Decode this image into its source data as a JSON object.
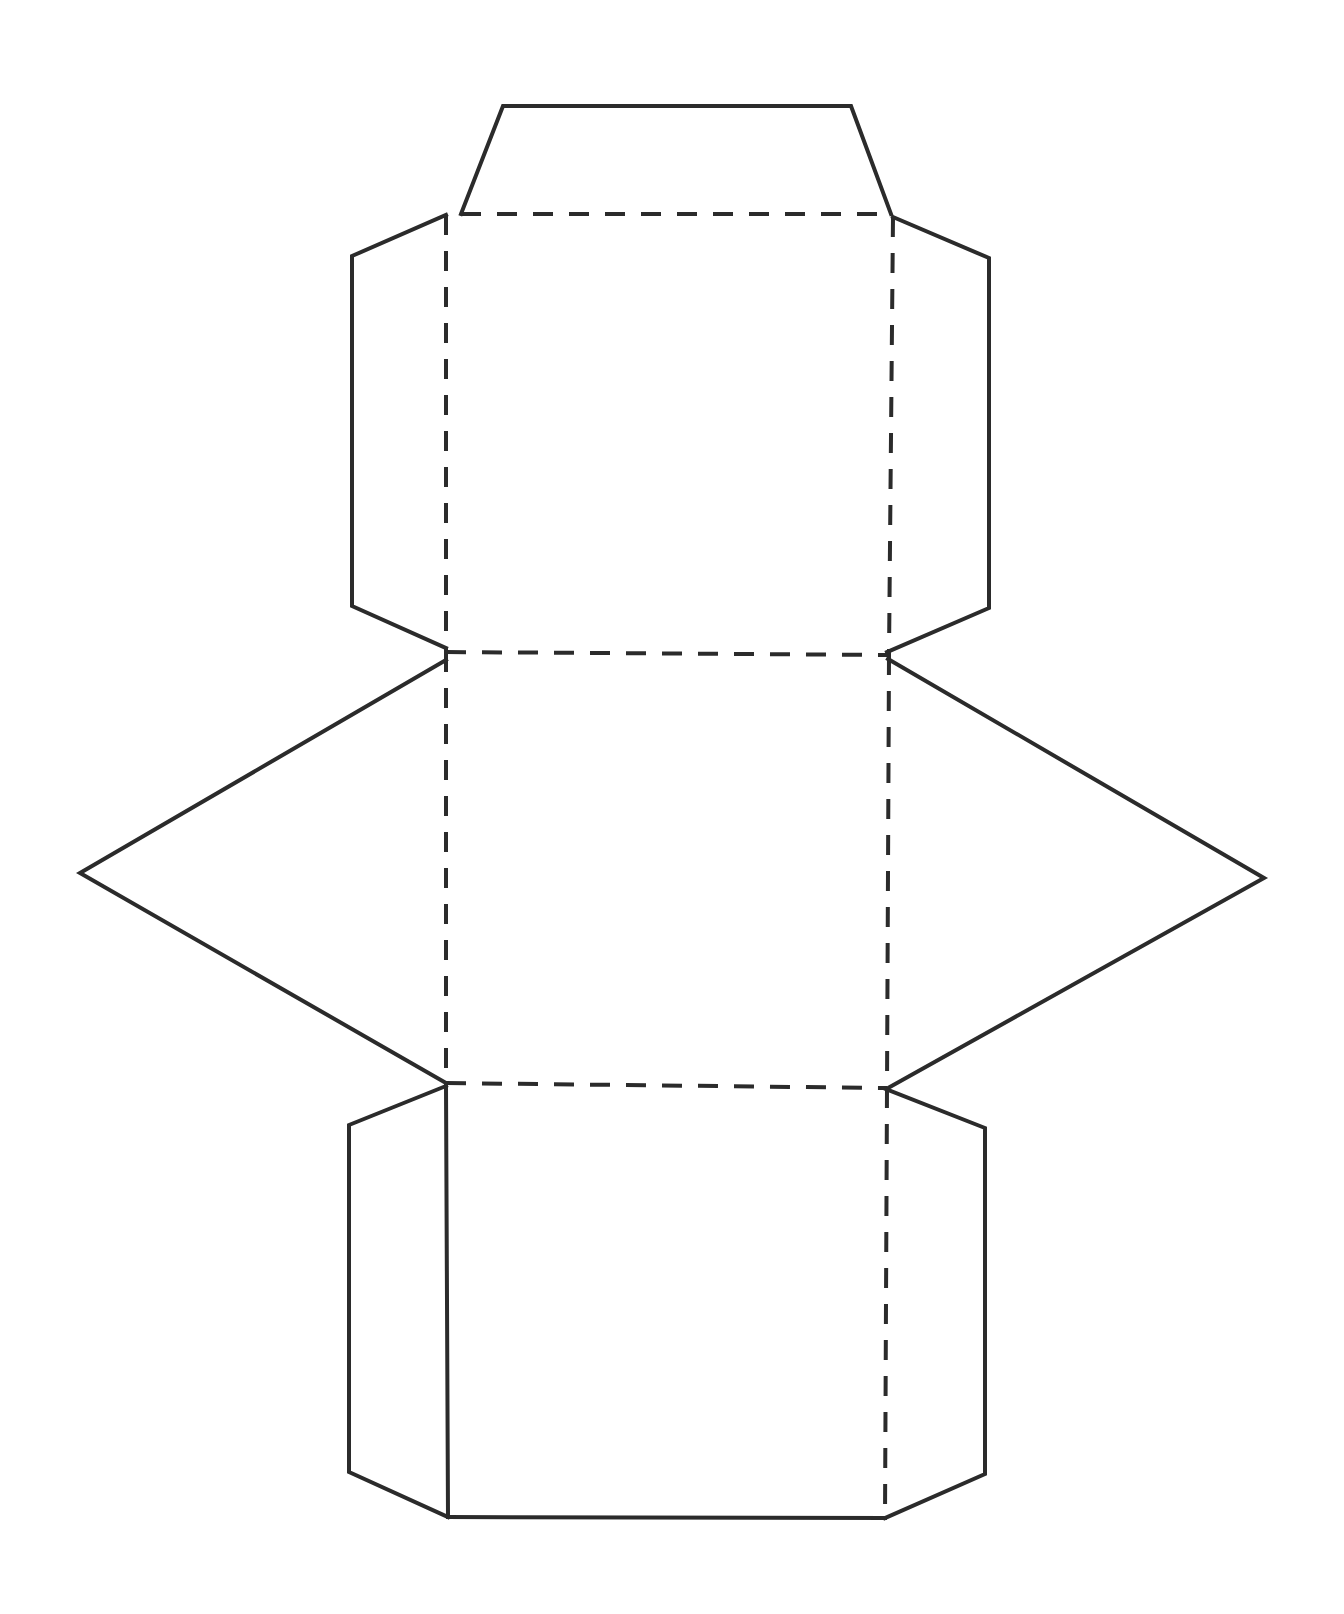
{
  "diagram": {
    "type": "paper-net-template",
    "canvas": {
      "width": 1344,
      "height": 1614,
      "background": "#ffffff"
    },
    "colors": {
      "line": "#2b2b2b"
    },
    "cut_lines": [
      {
        "name": "top-flap",
        "points": [
          [
            461,
            214
          ],
          [
            503,
            106
          ],
          [
            851,
            106
          ],
          [
            891,
            214
          ]
        ]
      },
      {
        "name": "upper-left-flap",
        "points": [
          [
            446,
            215
          ],
          [
            352,
            256
          ],
          [
            352,
            606
          ],
          [
            446,
            648
          ]
        ]
      },
      {
        "name": "upper-right-flap",
        "points": [
          [
            893,
            217
          ],
          [
            989,
            258
          ],
          [
            989,
            608
          ],
          [
            887,
            652
          ]
        ]
      },
      {
        "name": "left-triangle-flap",
        "points": [
          [
            446,
            660
          ],
          [
            80,
            873
          ],
          [
            446,
            1083
          ]
        ]
      },
      {
        "name": "right-triangle-flap",
        "points": [
          [
            888,
            659
          ],
          [
            1264,
            878
          ],
          [
            888,
            1088
          ]
        ]
      },
      {
        "name": "lower-left-flap",
        "points": [
          [
            446,
            1086
          ],
          [
            349,
            1125
          ],
          [
            349,
            1472
          ],
          [
            448,
            1517
          ]
        ]
      },
      {
        "name": "lower-right-flap",
        "points": [
          [
            886,
            1089
          ],
          [
            985,
            1128
          ],
          [
            985,
            1474
          ],
          [
            885,
            1518
          ]
        ]
      },
      {
        "name": "bottom-face-left-edge",
        "points": [
          [
            446,
            1086
          ],
          [
            448,
            1517
          ]
        ]
      },
      {
        "name": "bottom-face-bottom-edge",
        "points": [
          [
            448,
            1517
          ],
          [
            885,
            1518
          ]
        ]
      }
    ],
    "fold_lines": [
      {
        "name": "fold-top",
        "points": [
          [
            461,
            214
          ],
          [
            891,
            214
          ]
        ]
      },
      {
        "name": "fold-upper-left",
        "points": [
          [
            446,
            215
          ],
          [
            446,
            652
          ]
        ]
      },
      {
        "name": "fold-upper-right",
        "points": [
          [
            893,
            217
          ],
          [
            889,
            655
          ]
        ]
      },
      {
        "name": "fold-middle",
        "points": [
          [
            446,
            652
          ],
          [
            889,
            655
          ]
        ]
      },
      {
        "name": "fold-mid-left",
        "points": [
          [
            446,
            652
          ],
          [
            446,
            1083
          ]
        ]
      },
      {
        "name": "fold-mid-right",
        "points": [
          [
            889,
            655
          ],
          [
            887,
            1088
          ]
        ]
      },
      {
        "name": "fold-lower",
        "points": [
          [
            446,
            1083
          ],
          [
            887,
            1088
          ]
        ]
      },
      {
        "name": "fold-lower-right",
        "points": [
          [
            887,
            1088
          ],
          [
            885,
            1518
          ]
        ]
      }
    ]
  }
}
